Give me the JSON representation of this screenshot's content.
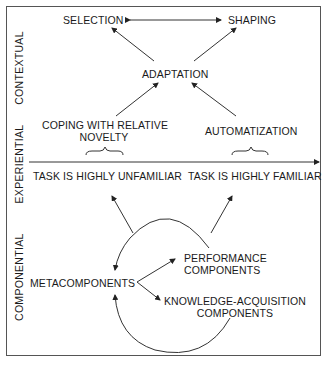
{
  "diagram": {
    "side_labels": {
      "contextual": "CONTEXTUAL",
      "experiential": "EXPERIENTIAL",
      "componential": "COMPONENTIAL"
    },
    "contextual": {
      "selection": "SELECTION",
      "shaping": "SHAPING",
      "adaptation": "ADAPTATION"
    },
    "experiential": {
      "novelty_line1": "COPING WITH RELATIVE",
      "novelty_line2": "NOVELTY",
      "automatization": "AUTOMATIZATION",
      "unfamiliar": "TASK IS HIGHLY UNFAMILIAR",
      "familiar": "TASK IS HIGHLY FAMILIAR"
    },
    "componential": {
      "metacomponents": "METACOMPONENTS",
      "performance_line1": "PERFORMANCE",
      "performance_line2": "COMPONENTS",
      "knowledge_line1": "KNOWLEDGE-ACQUISITION",
      "knowledge_line2": "COMPONENTS"
    },
    "colors": {
      "line": "#333333",
      "border": "#555555",
      "text": "#1a1a1a"
    }
  }
}
